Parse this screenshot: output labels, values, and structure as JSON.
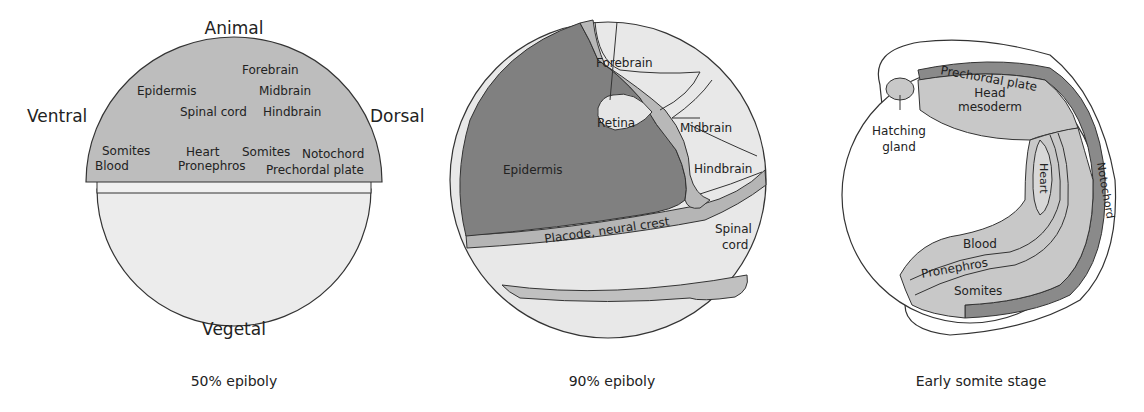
{
  "colors": {
    "dark_gray": "#808080",
    "mid_gray": "#b8b8b8",
    "light_gray": "#e8e8e8",
    "outline": "#333333"
  },
  "panels": [
    {
      "caption": "50% epiboly",
      "axes": {
        "top": "Animal",
        "bottom": "Vegetal",
        "left": "Ventral",
        "right": "Dorsal"
      },
      "labels": {
        "forebrain": "Forebrain",
        "epidermis": "Epidermis",
        "midbrain": "Midbrain",
        "spinal_cord": "Spinal cord",
        "hindbrain": "Hindbrain",
        "somites_left": "Somites",
        "blood": "Blood",
        "heart": "Heart",
        "pronephros": "Pronephros",
        "somites_right": "Somites",
        "notochord": "Notochord",
        "prechordal_plate": "Prechordal plate"
      }
    },
    {
      "caption": "90% epiboly",
      "labels": {
        "forebrain": "Forebrain",
        "retina": "Retina",
        "midbrain": "Midbrain",
        "epidermis": "Epidermis",
        "hindbrain": "Hindbrain",
        "placode": "Placode, neural crest",
        "spinal": "Spinal",
        "cord": "cord"
      }
    },
    {
      "caption": "Early somite stage",
      "labels": {
        "prechordal_plate": "Prechordal plate",
        "head": "Head",
        "mesoderm": "mesoderm",
        "hatching": "Hatching",
        "gland": "gland",
        "heart": "Heart",
        "notochord": "Notochord",
        "blood": "Blood",
        "pronephros": "Pronephros",
        "somites": "Somites"
      }
    }
  ]
}
